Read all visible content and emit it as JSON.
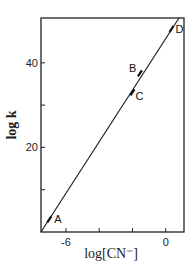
{
  "chart_data": {
    "type": "line",
    "title": "",
    "xlabel": "log[CN⁻]",
    "ylabel": "log k",
    "xlim": [
      -7.5,
      1.1
    ],
    "ylim": [
      0,
      50.6
    ],
    "x_ticks": [
      -6,
      -4,
      -2,
      0
    ],
    "x_tick_labels": [
      "-6",
      "",
      "",
      "0"
    ],
    "y_ticks": [
      10,
      20,
      30,
      40
    ],
    "y_tick_labels": [
      "",
      "20",
      "",
      "40"
    ],
    "grid": false,
    "legend": "none",
    "series": [
      {
        "name": "fit",
        "x": [
          -7.5,
          0.8
        ],
        "y": [
          0,
          50.6
        ]
      }
    ],
    "points": [
      {
        "label": "A",
        "x": -7.0,
        "y": 3.0
      },
      {
        "label": "B",
        "x": -1.55,
        "y": 37.5
      },
      {
        "label": "C",
        "x": -2.0,
        "y": 33.0
      },
      {
        "label": "D",
        "x": 0.35,
        "y": 48.0
      }
    ]
  }
}
